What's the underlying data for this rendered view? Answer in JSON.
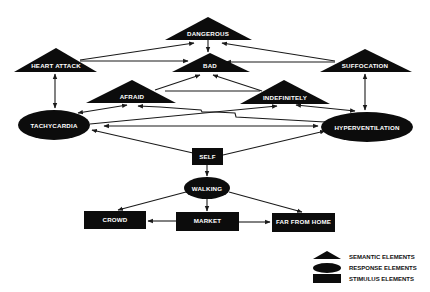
{
  "diagram": {
    "nodes": {
      "dangerous": {
        "label": "DANGEROUS",
        "type": "semantic"
      },
      "bad": {
        "label": "BAD",
        "type": "semantic"
      },
      "heart_attack": {
        "label": "HEART ATTACK",
        "type": "semantic"
      },
      "suffocation": {
        "label": "SUFFOCATION",
        "type": "semantic"
      },
      "afraid": {
        "label": "AFRAID",
        "type": "semantic"
      },
      "indefinitely": {
        "label": "INDEFINITELY",
        "type": "semantic"
      },
      "tachycardia": {
        "label": "TACHYCARDIA",
        "type": "response"
      },
      "hyperventilation": {
        "label": "HYPERVENTILATION",
        "type": "response"
      },
      "walking": {
        "label": "WALKING",
        "type": "response"
      },
      "self": {
        "label": "SELF",
        "type": "stimulus"
      },
      "crowd": {
        "label": "CROWD",
        "type": "stimulus"
      },
      "market": {
        "label": "MARKET",
        "type": "stimulus"
      },
      "far_from_home": {
        "label": "FAR FROM HOME",
        "type": "stimulus"
      }
    },
    "edges": [
      {
        "from": "DANGEROUS",
        "to": "BAD"
      },
      {
        "from": "HEART ATTACK",
        "to": "DANGEROUS"
      },
      {
        "from": "HEART ATTACK",
        "to": "BAD"
      },
      {
        "from": "SUFFOCATION",
        "to": "DANGEROUS"
      },
      {
        "from": "SUFFOCATION",
        "to": "BAD"
      },
      {
        "from": "AFRAID",
        "to": "BAD"
      },
      {
        "from": "INDEFINITELY",
        "to": "BAD"
      },
      {
        "from": "HEART ATTACK",
        "to": "TACHYCARDIA",
        "bidirectional": true
      },
      {
        "from": "SUFFOCATION",
        "to": "HYPERVENTILATION",
        "bidirectional": true
      },
      {
        "from": "TACHYCARDIA",
        "to": "AFRAID",
        "bidirectional": true
      },
      {
        "from": "HYPERVENTILATION",
        "to": "INDEFINITELY",
        "bidirectional": true
      },
      {
        "from": "TACHYCARDIA",
        "to": "HYPERVENTILATION",
        "bidirectional": true
      },
      {
        "from": "HYPERVENTILATION",
        "to": "AFRAID"
      },
      {
        "from": "TACHYCARDIA",
        "to": "INDEFINITELY"
      },
      {
        "from": "SELF",
        "to": "TACHYCARDIA"
      },
      {
        "from": "SELF",
        "to": "HYPERVENTILATION"
      },
      {
        "from": "SELF",
        "to": "WALKING"
      },
      {
        "from": "WALKING",
        "to": "CROWD"
      },
      {
        "from": "WALKING",
        "to": "MARKET"
      },
      {
        "from": "WALKING",
        "to": "FAR FROM HOME"
      },
      {
        "from": "MARKET",
        "to": "CROWD"
      },
      {
        "from": "MARKET",
        "to": "FAR FROM HOME"
      }
    ]
  },
  "legend": {
    "semantic": "SEMANTIC ELEMENTS",
    "response": "RESPONSE ELEMENTS",
    "stimulus": "STIMULUS ELEMENTS"
  },
  "colors": {
    "node_fill": "#0c0c0c",
    "node_text": "#ffffff",
    "edge": "#1a1a1a",
    "background": "#ffffff"
  }
}
